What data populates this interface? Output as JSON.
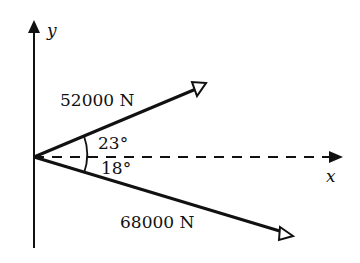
{
  "diagram": {
    "axes": {
      "x_label": "x",
      "y_label": "y"
    },
    "forces": [
      {
        "name": "upper-force",
        "label": "52000 N",
        "magnitude_N": 52000,
        "angle_deg": 23,
        "direction": "above x-axis"
      },
      {
        "name": "lower-force",
        "label": "68000 N",
        "magnitude_N": 68000,
        "angle_deg": 18,
        "direction": "below x-axis"
      }
    ],
    "angles": {
      "upper_label": "23°",
      "lower_label": "18°"
    },
    "colors": {
      "line": "#111111",
      "background": "#ffffff"
    }
  }
}
